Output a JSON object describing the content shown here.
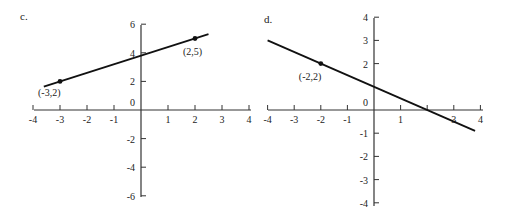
{
  "chart_data": [
    {
      "type": "line",
      "panel_label": "c.",
      "title": "",
      "xlabel": "",
      "ylabel": "",
      "xlim": [
        -4,
        4
      ],
      "ylim": [
        -6,
        6
      ],
      "x_ticks": [
        -4,
        -3,
        -2,
        -1,
        1,
        2,
        3,
        4
      ],
      "x_tick_labels": [
        "-4",
        "-3",
        "-2",
        "-1",
        "1",
        "2",
        "3",
        "4"
      ],
      "y_ticks": [
        6,
        4,
        2,
        0,
        -2,
        -4,
        -6
      ],
      "y_tick_labels": [
        "6",
        "4",
        "2",
        "0",
        "-2",
        "-4",
        "-6"
      ],
      "grid": false,
      "series": [
        {
          "name": "line c",
          "equation": "y = 0.6x + 3.8",
          "x": [
            -3.6,
            2.5
          ],
          "y": [
            1.64,
            5.3
          ]
        }
      ],
      "points": [
        {
          "x": -3,
          "y": 2,
          "label": "(-3,2)"
        },
        {
          "x": 2,
          "y": 5,
          "label": "(2,5)"
        }
      ]
    },
    {
      "type": "line",
      "panel_label": "d.",
      "title": "",
      "xlabel": "",
      "ylabel": "",
      "xlim": [
        -4,
        4
      ],
      "ylim": [
        -4,
        4
      ],
      "x_ticks": [
        -4,
        -3,
        -2,
        -1,
        1,
        2,
        3,
        4
      ],
      "x_tick_labels": [
        "-4",
        "-3",
        "-2",
        "-1",
        "1",
        "",
        "3",
        "4"
      ],
      "y_ticks": [
        4,
        3,
        2,
        0,
        -1,
        -2,
        -3,
        -4
      ],
      "y_tick_labels": [
        "4",
        "3",
        "2",
        "0",
        "-1",
        "-2",
        "-3",
        "-4"
      ],
      "grid": false,
      "series": [
        {
          "name": "line d",
          "equation": "y = -0.5x + 1",
          "x": [
            -4,
            3.8
          ],
          "y": [
            3,
            -0.9
          ]
        }
      ],
      "points": [
        {
          "x": -2,
          "y": 2,
          "label": "(-2,2)"
        }
      ]
    }
  ]
}
